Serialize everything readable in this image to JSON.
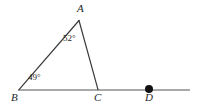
{
  "figure": {
    "type": "geometry-diagram",
    "background_color": "#ffffff",
    "stroke_color_triangle": "#3a3a3a",
    "stroke_color_ray": "#8c8c8c",
    "text_color": "#262626"
  },
  "points": {
    "A": {
      "label": "A",
      "x": 79,
      "y": 20
    },
    "B": {
      "label": "B",
      "x": 19,
      "y": 90
    },
    "C": {
      "label": "C",
      "x": 98,
      "y": 90
    },
    "D": {
      "label": "D",
      "x": 149,
      "y": 90,
      "marker": "filled-dot",
      "marker_radius": 4
    }
  },
  "angles": [
    {
      "at": "A",
      "value": "52°",
      "degrees": 52
    },
    {
      "at": "B",
      "value": "49°",
      "degrees": 49
    }
  ],
  "segments": [
    {
      "name": "AB",
      "from": "A",
      "to": "B"
    },
    {
      "name": "AC",
      "from": "A",
      "to": "C"
    },
    {
      "name": "ray-BD",
      "from": "B",
      "to": "line-end",
      "x1": 18,
      "y1": 90,
      "x2": 190,
      "y2": 90
    }
  ]
}
